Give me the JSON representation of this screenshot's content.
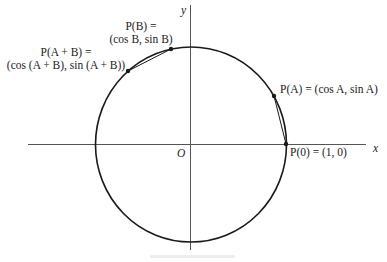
{
  "diagram": {
    "type": "unit-circle-angle-addition",
    "axes": {
      "x_label": "x",
      "y_label": "y",
      "origin_label": "O"
    },
    "points": [
      {
        "id": "P0",
        "line1": "P(0) = (1, 0)",
        "line2": ""
      },
      {
        "id": "PA",
        "line1": "P(A) = (cos A, sin A)",
        "line2": ""
      },
      {
        "id": "PB",
        "line1": "P(B) =",
        "line2": "(cos B, sin B)"
      },
      {
        "id": "PAB",
        "line1": "P(A + B) =",
        "line2": "(cos (A + B), sin (A + B))"
      }
    ],
    "chords": [
      {
        "from": "P0",
        "to": "PA"
      },
      {
        "from": "PB",
        "to": "PAB"
      }
    ],
    "colors": {
      "stroke": "#1a1a1a",
      "axis": "#555555",
      "text": "#222222",
      "background": "#ffffff"
    }
  }
}
